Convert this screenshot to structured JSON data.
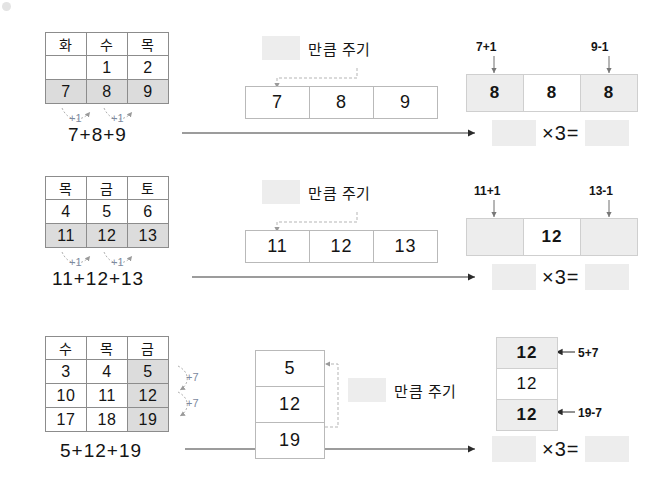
{
  "rows": [
    {
      "id": "row-1",
      "calendar": {
        "headers": [
          "화",
          "수",
          "목"
        ],
        "body": [
          [
            "",
            "1",
            "2"
          ],
          [
            "7",
            "8",
            "9"
          ]
        ],
        "highlight_row_index": 1
      },
      "step_notes": [
        "+1",
        "+1"
      ],
      "sum_expression": "7+8+9",
      "give_label": "만큼 주기",
      "strip_values": [
        "7",
        "8",
        "9"
      ],
      "result_left_note": "7+1",
      "result_right_note": "9-1",
      "result_values": [
        "8",
        "8",
        "8"
      ],
      "result_blank_flags": [
        false,
        false,
        false
      ],
      "equation_operator": "×3="
    },
    {
      "id": "row-2",
      "calendar": {
        "headers": [
          "목",
          "금",
          "토"
        ],
        "body": [
          [
            "4",
            "5",
            "6"
          ],
          [
            "11",
            "12",
            "13"
          ]
        ],
        "highlight_row_index": 1
      },
      "step_notes": [
        "+1",
        "+1"
      ],
      "sum_expression": "11+12+13",
      "give_label": "만큼 주기",
      "strip_values": [
        "11",
        "12",
        "13"
      ],
      "result_left_note": "11+1",
      "result_right_note": "13-1",
      "result_values": [
        "",
        "12",
        ""
      ],
      "result_blank_flags": [
        true,
        false,
        true
      ],
      "equation_operator": "×3="
    },
    {
      "id": "row-3",
      "calendar": {
        "headers": [
          "수",
          "목",
          "금"
        ],
        "body": [
          [
            "3",
            "4",
            "5"
          ],
          [
            "10",
            "11",
            "12"
          ],
          [
            "17",
            "18",
            "19"
          ]
        ],
        "highlight_column_index": 2
      },
      "step_notes": [
        "+7",
        "+7"
      ],
      "sum_expression": "5+12+19",
      "give_label": "만큼 주기",
      "strip_values": [
        "5",
        "12",
        "19"
      ],
      "result_top_note": "5+7",
      "result_bottom_note": "19-7",
      "result_values": [
        "12",
        "12",
        "12"
      ],
      "equation_operator": "×3="
    }
  ],
  "colors": {
    "highlight": "#dcdcdc",
    "blank": "#ededed",
    "border": "#8c8c8c",
    "light_border": "#cfcfcf",
    "note_accent": "#7d8aa0"
  }
}
